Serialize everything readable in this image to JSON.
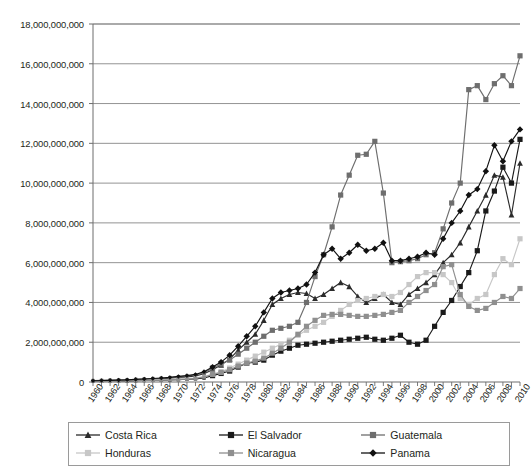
{
  "chart_data": {
    "type": "line",
    "title": "",
    "xlabel": "",
    "ylabel": "",
    "ylim": [
      0,
      18000000000
    ],
    "ytick_step": 2000000000,
    "grid": true,
    "legend_position": "bottom",
    "x_tick_interval": 1,
    "x_label_interval": 2,
    "ytick_labels": [
      "0",
      "2,000,000,000",
      "4,000,000,000",
      "6,000,000,000",
      "8,000,000,000",
      "10,000,000,000",
      "12,000,000,000",
      "14,000,000,000",
      "16,000,000,000",
      "18,000,000,000"
    ],
    "ytick_values": [
      0,
      2000000000,
      4000000000,
      6000000000,
      8000000000,
      10000000000,
      12000000000,
      14000000000,
      16000000000,
      18000000000
    ],
    "x": [
      1960,
      1961,
      1962,
      1963,
      1964,
      1965,
      1966,
      1967,
      1968,
      1969,
      1970,
      1971,
      1972,
      1973,
      1974,
      1975,
      1976,
      1977,
      1978,
      1979,
      1980,
      1981,
      1982,
      1983,
      1984,
      1985,
      1986,
      1987,
      1988,
      1989,
      1990,
      1991,
      1992,
      1993,
      1994,
      1995,
      1996,
      1997,
      1998,
      1999,
      2000,
      2001,
      2002,
      2003,
      2004,
      2005,
      2006,
      2007,
      2008,
      2009,
      2010
    ],
    "xtick_labels": [
      "1960",
      "1962",
      "1964",
      "1966",
      "1968",
      "1970",
      "1972",
      "1974",
      "1976",
      "1978",
      "1980",
      "1982",
      "1984",
      "1986",
      "1988",
      "1990",
      "1992",
      "1994",
      "1996",
      "1998",
      "2000",
      "2002",
      "2004",
      "2006",
      "2008",
      "2010"
    ],
    "series": [
      {
        "name": "Costa Rica",
        "color": "#2b2b2b",
        "marker": "triangle",
        "values": [
          60000000,
          70000000,
          80000000,
          90000000,
          100000000,
          120000000,
          140000000,
          150000000,
          170000000,
          190000000,
          230000000,
          260000000,
          300000000,
          420000000,
          620000000,
          850000000,
          1150000000,
          1600000000,
          2000000000,
          2400000000,
          3100000000,
          3900000000,
          4200000000,
          4400000000,
          4500000000,
          4450000000,
          4200000000,
          4400000000,
          4700000000,
          5000000000,
          4800000000,
          4300000000,
          4000000000,
          4200000000,
          4400000000,
          4000000000,
          3900000000,
          4400000000,
          4700000000,
          5000000000,
          5400000000,
          6000000000,
          6400000000,
          7000000000,
          7800000000,
          8600000000,
          9400000000,
          10400000000,
          10300000000,
          8400000000,
          11000000000
        ]
      },
      {
        "name": "El Salvador",
        "color": "#1a1a1a",
        "marker": "square",
        "values": [
          40000000,
          45000000,
          50000000,
          55000000,
          60000000,
          70000000,
          80000000,
          90000000,
          95000000,
          100000000,
          120000000,
          140000000,
          160000000,
          200000000,
          320000000,
          430000000,
          550000000,
          750000000,
          950000000,
          1000000000,
          1100000000,
          1350000000,
          1550000000,
          1700000000,
          1850000000,
          1900000000,
          1950000000,
          2000000000,
          2050000000,
          2100000000,
          2150000000,
          2200000000,
          2250000000,
          2150000000,
          2100000000,
          2200000000,
          2350000000,
          2000000000,
          1900000000,
          2100000000,
          2800000000,
          3500000000,
          4100000000,
          4800000000,
          5500000000,
          6600000000,
          8600000000,
          9600000000,
          10800000000,
          10000000000,
          12200000000
        ]
      },
      {
        "name": "Guatemala",
        "color": "#6e6e6e",
        "marker": "square",
        "values": [
          70000000,
          80000000,
          90000000,
          100000000,
          110000000,
          130000000,
          150000000,
          170000000,
          190000000,
          220000000,
          260000000,
          300000000,
          350000000,
          450000000,
          700000000,
          900000000,
          1100000000,
          1400000000,
          1700000000,
          2000000000,
          2300000000,
          2600000000,
          2700000000,
          2800000000,
          3000000000,
          4000000000,
          5300000000,
          6400000000,
          7800000000,
          9400000000,
          10400000000,
          11400000000,
          11450000000,
          12100000000,
          9500000000,
          6000000000,
          6050000000,
          6100000000,
          6200000000,
          6400000000,
          6500000000,
          7700000000,
          9000000000,
          10000000000,
          14700000000,
          14900000000,
          14200000000,
          15000000000,
          15400000000,
          14900000000,
          16400000000
        ]
      },
      {
        "name": "Honduras",
        "color": "#c7c7c7",
        "marker": "square",
        "values": [
          50000000,
          55000000,
          60000000,
          70000000,
          80000000,
          90000000,
          100000000,
          110000000,
          120000000,
          130000000,
          150000000,
          170000000,
          200000000,
          280000000,
          400000000,
          520000000,
          700000000,
          900000000,
          1100000000,
          1300000000,
          1500000000,
          1700000000,
          1900000000,
          2100000000,
          2350000000,
          2600000000,
          2800000000,
          3000000000,
          3300000000,
          3600000000,
          3900000000,
          4100000000,
          4200000000,
          4300000000,
          4400000000,
          4300000000,
          4500000000,
          4900000000,
          5300000000,
          5500000000,
          5500000000,
          5400000000,
          5000000000,
          4200000000,
          3900000000,
          4200000000,
          4400000000,
          5400000000,
          6200000000,
          5900000000,
          7200000000
        ]
      },
      {
        "name": "Nicaragua",
        "color": "#8f8f8f",
        "marker": "square",
        "values": [
          45000000,
          50000000,
          55000000,
          60000000,
          70000000,
          80000000,
          85000000,
          95000000,
          100000000,
          115000000,
          130000000,
          150000000,
          180000000,
          250000000,
          380000000,
          480000000,
          620000000,
          800000000,
          950000000,
          1050000000,
          1200000000,
          1450000000,
          1700000000,
          2000000000,
          2400000000,
          2800000000,
          3100000000,
          3350000000,
          3400000000,
          3400000000,
          3350000000,
          3300000000,
          3300000000,
          3350000000,
          3400000000,
          3500000000,
          3600000000,
          4000000000,
          4300000000,
          4600000000,
          4900000000,
          5800000000,
          5900000000,
          4400000000,
          3800000000,
          3600000000,
          3700000000,
          4000000000,
          4300000000,
          4200000000,
          4700000000
        ]
      },
      {
        "name": "Panama",
        "color": "#111111",
        "marker": "diamond",
        "values": [
          65000000,
          75000000,
          85000000,
          95000000,
          110000000,
          130000000,
          150000000,
          175000000,
          200000000,
          230000000,
          280000000,
          320000000,
          380000000,
          520000000,
          750000000,
          1000000000,
          1350000000,
          1800000000,
          2300000000,
          2800000000,
          3500000000,
          4200000000,
          4500000000,
          4600000000,
          4700000000,
          4900000000,
          5500000000,
          6400000000,
          6700000000,
          6200000000,
          6500000000,
          6900000000,
          6600000000,
          6700000000,
          7000000000,
          6100000000,
          6100000000,
          6200000000,
          6300000000,
          6500000000,
          6400000000,
          7200000000,
          8000000000,
          8600000000,
          9400000000,
          9700000000,
          10600000000,
          11900000000,
          11100000000,
          12100000000,
          12700000000
        ]
      }
    ]
  },
  "legend": {
    "items": [
      {
        "label": "Costa Rica",
        "color": "#2b2b2b",
        "marker": "triangle"
      },
      {
        "label": "El Salvador",
        "color": "#1a1a1a",
        "marker": "square"
      },
      {
        "label": "Guatemala",
        "color": "#6e6e6e",
        "marker": "square"
      },
      {
        "label": "Honduras",
        "color": "#c7c7c7",
        "marker": "square"
      },
      {
        "label": "Nicaragua",
        "color": "#8f8f8f",
        "marker": "square"
      },
      {
        "label": "Panama",
        "color": "#111111",
        "marker": "diamond"
      }
    ]
  },
  "colors": {
    "axis": "#6d6d6d",
    "grid": "#808080",
    "text": "#231f20",
    "background": "#ffffff"
  }
}
